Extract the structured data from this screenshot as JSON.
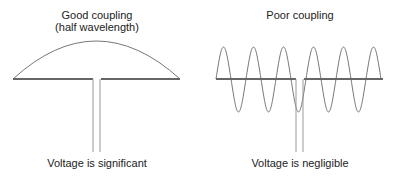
{
  "left_panel": {
    "title_line1": "Good coupling",
    "title_line2": "(half wavelength)",
    "caption": "Voltage is significant",
    "waveform": "half-wave arc"
  },
  "right_panel": {
    "title": "Poor coupling",
    "caption": "Voltage is negligible",
    "waveform": "multi-cycle sine wave"
  },
  "colors": {
    "antenna": "#666666",
    "wave": "#777777",
    "feedline": "#999999",
    "text": "#222222"
  }
}
